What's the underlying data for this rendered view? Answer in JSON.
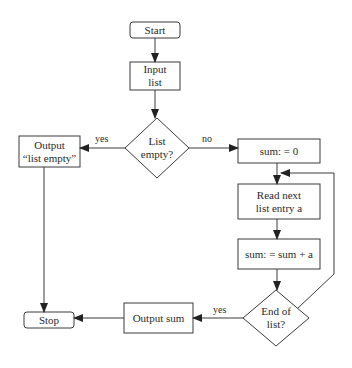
{
  "diagram": {
    "type": "flowchart",
    "nodes": [
      {
        "id": "start",
        "kind": "terminal",
        "label": "Start",
        "x": 130,
        "y": 22,
        "w": 50,
        "h": 16
      },
      {
        "id": "input_list",
        "kind": "process",
        "label": "Input\nlist",
        "x": 130,
        "y": 62,
        "w": 50,
        "h": 28
      },
      {
        "id": "list_empty",
        "kind": "decision",
        "label": "List\nempty?",
        "cx": 157,
        "cy": 148,
        "rx": 32,
        "ry": 30
      },
      {
        "id": "output_list_empty",
        "kind": "process",
        "label": "Output\n“list empty”",
        "x": 19,
        "y": 136,
        "w": 61,
        "h": 31
      },
      {
        "id": "sum_init",
        "kind": "process",
        "label": "sum: = 0",
        "x": 238,
        "y": 139,
        "w": 82,
        "h": 24
      },
      {
        "id": "read_next",
        "kind": "process",
        "label": "Read next\nlist entry a",
        "x": 238,
        "y": 184,
        "w": 82,
        "h": 35
      },
      {
        "id": "sum_add",
        "kind": "process",
        "label": "sum: = sum + a",
        "x": 238,
        "y": 239,
        "w": 82,
        "h": 30
      },
      {
        "id": "end_of_list",
        "kind": "decision",
        "label": "End of\nlist?",
        "cx": 276,
        "cy": 318,
        "rx": 33,
        "ry": 28
      },
      {
        "id": "output_sum",
        "kind": "process",
        "label": "Output sum",
        "x": 124,
        "y": 303,
        "w": 69,
        "h": 30
      },
      {
        "id": "stop",
        "kind": "terminal",
        "label": "Stop",
        "x": 24,
        "y": 312,
        "w": 50,
        "h": 16
      }
    ],
    "edges": [
      {
        "from": "start",
        "to": "input_list",
        "label": ""
      },
      {
        "from": "input_list",
        "to": "list_empty",
        "label": ""
      },
      {
        "from": "list_empty",
        "to": "output_list_empty",
        "label": "yes"
      },
      {
        "from": "list_empty",
        "to": "sum_init",
        "label": "no"
      },
      {
        "from": "sum_init",
        "to": "read_next",
        "label": ""
      },
      {
        "from": "read_next",
        "to": "sum_add",
        "label": ""
      },
      {
        "from": "sum_add",
        "to": "end_of_list",
        "label": ""
      },
      {
        "from": "end_of_list",
        "to": "read_next",
        "label": ""
      },
      {
        "from": "end_of_list",
        "to": "output_sum",
        "label": "yes"
      },
      {
        "from": "output_sum",
        "to": "stop",
        "label": ""
      },
      {
        "from": "output_list_empty",
        "to": "stop",
        "label": ""
      }
    ],
    "edge_labels": {
      "list_empty_yes": "yes",
      "list_empty_no": "no",
      "end_of_list_yes": "yes"
    }
  }
}
